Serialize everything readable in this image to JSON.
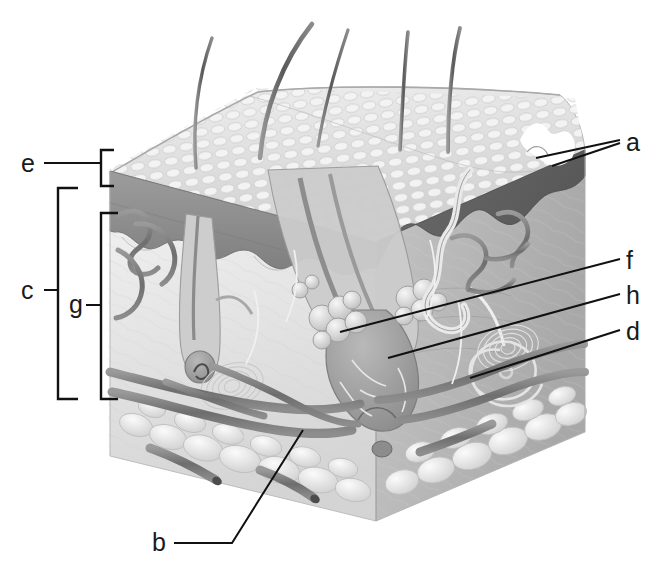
{
  "figure": {
    "kind": "anatomical-illustration",
    "background_color": "#ffffff",
    "line_color": "#111111",
    "width": 663,
    "height": 568
  },
  "labels": [
    {
      "id": "a",
      "text": "a",
      "x": 626,
      "y": 131,
      "side": "right",
      "leader": "two-line pointer to skin-surface pore / hair shaft opening"
    },
    {
      "id": "f",
      "text": "f",
      "x": 626,
      "y": 250,
      "side": "right",
      "leader": "line to sebaceous gland lobules"
    },
    {
      "id": "h",
      "text": "h",
      "x": 626,
      "y": 285,
      "side": "right",
      "leader": "line to hair follicle bulb"
    },
    {
      "id": "d",
      "text": "d",
      "x": 626,
      "y": 321,
      "side": "right",
      "leader": "line to coiled sweat gland"
    },
    {
      "id": "b",
      "text": "b",
      "x": 152,
      "y": 524,
      "side": "bottom-left",
      "leader": "elbowed line up-right to lamellated corpuscle"
    },
    {
      "id": "e",
      "text": "e",
      "x": 21,
      "y": 151,
      "side": "left",
      "leader": "line to small bracket spanning epidermis"
    },
    {
      "id": "c",
      "text": "c",
      "x": 21,
      "y": 278,
      "side": "left",
      "leader": "line to large outer bracket spanning dermis + hypodermis"
    },
    {
      "id": "g",
      "text": "g",
      "x": 70,
      "y": 288,
      "side": "left",
      "leader": "line to inner bracket spanning dermis"
    }
  ],
  "brackets": [
    {
      "name": "epidermis-bracket",
      "for_label": "e",
      "x": 101,
      "y_top": 149,
      "y_bottom": 186,
      "arm": 13,
      "tick_y": 167
    },
    {
      "name": "dermis-hypodermis-bracket",
      "for_label": "c",
      "x": 58,
      "y_top": 188,
      "y_bottom": 399,
      "arm": 20,
      "tick_y": 288
    },
    {
      "name": "dermis-bracket",
      "for_label": "g",
      "x": 101,
      "y_top": 213,
      "y_bottom": 399,
      "arm": 17,
      "tick_y": 305
    }
  ],
  "structures": [
    {
      "name": "hair-shafts",
      "count": 5,
      "note": "emerging above skin surface"
    },
    {
      "name": "epidermis",
      "note": "dark banded upper layer on cut face"
    },
    {
      "name": "dermal-papillae",
      "note": "wavy dermo-epidermal junction"
    },
    {
      "name": "dermis",
      "note": "pale fibrous middle layer"
    },
    {
      "name": "hypodermis",
      "note": "adipose lobules along lower edge"
    },
    {
      "name": "hair-follicle",
      "count": 2
    },
    {
      "name": "sebaceous-gland",
      "count": 3
    },
    {
      "name": "sweat-gland-coil",
      "count": 2
    },
    {
      "name": "lamellated-corpuscle",
      "count": 2
    },
    {
      "name": "blood-vessels",
      "note": "arterioles and venules networks"
    },
    {
      "name": "arrector-pili-muscle",
      "count": 1
    }
  ],
  "palette": {
    "paper": "#ffffff",
    "ink": "#111111",
    "surface_light": "#e8e8e8",
    "surface_mid": "#c9c9c9",
    "epidermis_dark": "#8e8e8e",
    "epidermis_darker": "#6f6f6f",
    "dermis_pale": "#ededed",
    "dermis_mid": "#d2d2d2",
    "vessel_dark": "#7a7a7a",
    "fat_light": "#f2f2f2",
    "fat_edge": "#bdbdbd"
  }
}
